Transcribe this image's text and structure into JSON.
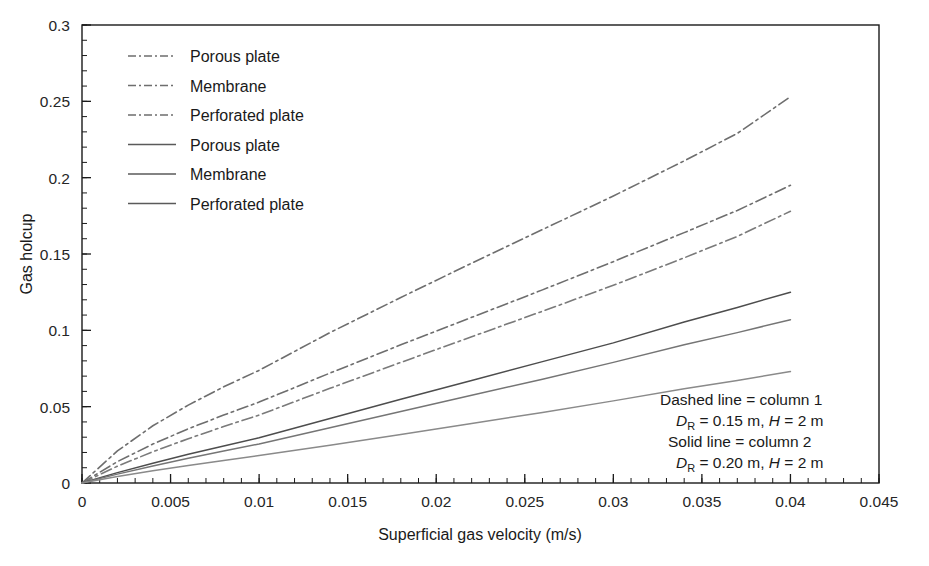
{
  "chart_data": {
    "type": "line",
    "title": "",
    "xlabel": "Superficial gas velocity (m/s)",
    "ylabel": "Gas holcup",
    "xlim": [
      0,
      0.045
    ],
    "ylim": [
      0,
      0.3
    ],
    "xticks": [
      0,
      0.005,
      0.01,
      0.015,
      0.02,
      0.025,
      0.03,
      0.035,
      0.04,
      0.045
    ],
    "xticklabels": [
      "0",
      "0.005",
      "0.01",
      "0.015",
      "0.02",
      "0.025",
      "0.03",
      "0.035",
      "0.04",
      "0.045"
    ],
    "yticks": [
      0,
      0.05,
      0.1,
      0.15,
      0.2,
      0.25,
      0.3
    ],
    "yticklabels": [
      "0",
      "0.05",
      "0.1",
      "0.15",
      "0.2",
      "0.25",
      "0.3"
    ],
    "x_minor_tick_step": 0.001,
    "y_minor_tick_step": 0.01,
    "grid": false,
    "legend_position": "upper-left",
    "x": [
      0,
      0.002,
      0.004,
      0.006,
      0.008,
      0.01,
      0.014,
      0.018,
      0.022,
      0.026,
      0.03,
      0.034,
      0.037,
      0.04
    ],
    "series": [
      {
        "name": "Porous plate",
        "style": "dash-dot",
        "column": "column 1",
        "color": "#6e6e6e",
        "values": [
          0,
          0.021,
          0.0375,
          0.051,
          0.063,
          0.0738,
          0.0985,
          0.1215,
          0.144,
          0.166,
          0.188,
          0.211,
          0.229,
          0.253
        ]
      },
      {
        "name": "Membrane",
        "style": "dash-dot",
        "column": "column 1",
        "color": "#6e6e6e",
        "values": [
          0,
          0.014,
          0.0255,
          0.0355,
          0.0445,
          0.053,
          0.072,
          0.0905,
          0.1085,
          0.1265,
          0.145,
          0.164,
          0.1785,
          0.195
        ]
      },
      {
        "name": "Perforated plate",
        "style": "dash-dot",
        "column": "column 1",
        "color": "#7a7a7a",
        "values": [
          0,
          0.011,
          0.0205,
          0.029,
          0.037,
          0.0445,
          0.062,
          0.079,
          0.0958,
          0.1125,
          0.1295,
          0.1475,
          0.1615,
          0.178
        ]
      },
      {
        "name": "Porous plate",
        "style": "solid",
        "column": "column 2",
        "color": "#4d4d4d",
        "values": [
          0,
          0.0068,
          0.013,
          0.0188,
          0.0243,
          0.0296,
          0.0422,
          0.0548,
          0.0672,
          0.0795,
          0.0918,
          0.1055,
          0.115,
          0.125
        ]
      },
      {
        "name": "Membrane",
        "style": "solid",
        "column": "column 2",
        "color": "#757575",
        "values": [
          0,
          0.0058,
          0.0112,
          0.0162,
          0.021,
          0.0256,
          0.0362,
          0.0468,
          0.0575,
          0.068,
          0.079,
          0.0905,
          0.0985,
          0.107
        ]
      },
      {
        "name": "Perforated plate",
        "style": "solid",
        "column": "column 2",
        "color": "#8a8a8a",
        "values": [
          0,
          0.0042,
          0.008,
          0.0115,
          0.0148,
          0.018,
          0.0248,
          0.0318,
          0.039,
          0.0462,
          0.0538,
          0.0618,
          0.0672,
          0.073
        ]
      }
    ],
    "legend": [
      {
        "label": "Porous plate",
        "style": "dash-dot"
      },
      {
        "label": "Membrane",
        "style": "dash-dot"
      },
      {
        "label": "Perforated plate",
        "style": "dash-dot"
      },
      {
        "label": "Porous plate",
        "style": "solid"
      },
      {
        "label": "Membrane",
        "style": "solid"
      },
      {
        "label": "Perforated plate",
        "style": "solid"
      }
    ],
    "annotations": [
      {
        "id": "dashed-line-note",
        "text": "Dashed line = column 1"
      },
      {
        "id": "dashed-line-dims",
        "text": "D",
        "sub": "R",
        "rest": " = 0.15 m, H = 2 m",
        "diameter": "0.15",
        "height": "2"
      },
      {
        "id": "solid-line-note",
        "text": "Solid line = column 2"
      },
      {
        "id": "solid-line-dims",
        "text": "D",
        "sub": "R",
        "rest": " = 0.20 m, H = 2 m",
        "diameter": "0.20",
        "height": "2"
      }
    ]
  },
  "annotation_text": {
    "dashed_note": "Dashed line = column 1",
    "solid_note": "Solid line = column 2",
    "d_symbol": "D",
    "d_subscript": "R",
    "dashed_dims_eq": " = 0.15 m, ",
    "solid_dims_eq": " = 0.20 m, ",
    "h_symbol": "H",
    "h_value": " = 2 m"
  }
}
